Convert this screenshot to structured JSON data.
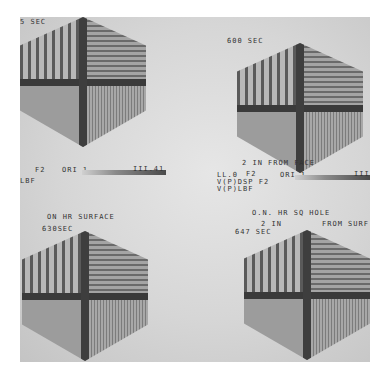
{
  "image": {
    "description": "Grayscale photograph of four hexagonal thermal/ultrasonic scan displays in a 2x2 grid",
    "panels": [
      {
        "position": "top-left",
        "time_label": "5 SEC"
      },
      {
        "position": "top-right",
        "time_label": "600 SEC",
        "caption": "2 IN FROM FACE"
      },
      {
        "position": "bottom-left",
        "time_label": "630SEC",
        "caption": "ON HR SURFACE"
      },
      {
        "position": "bottom-right",
        "time_label": "647 SEC",
        "caption_line1": "O.N. HR SQ HOLE",
        "caption_line2a": "2 IN",
        "caption_line2b": "FROM SURF"
      }
    ],
    "scale_left": {
      "f_label": "F2",
      "ori_label": "ORI 1",
      "end_label": "III.41",
      "sub_label": "LBF"
    },
    "scale_right": {
      "ll_label": "LL.0",
      "f_label": "F2",
      "ori_label": "ORI 1",
      "end_label": "III.T",
      "line2": "V(P)DSP F2",
      "line3": "V(P)LBF"
    }
  }
}
